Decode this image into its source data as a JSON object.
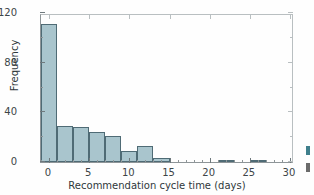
{
  "chart_data": {
    "type": "bar",
    "title": "",
    "xlabel": "Recommendation cycle time (days)",
    "ylabel": "Frequency",
    "xlim": [
      -1,
      30.5
    ],
    "ylim": [
      0,
      120
    ],
    "grid": false,
    "legend": null,
    "bin_width": 2,
    "bar_color": "#a9c5cd",
    "bar_edge_color": "#4f6b75",
    "x_ticks": [
      0,
      5,
      10,
      15,
      20,
      25,
      30
    ],
    "x_tick_labels": [
      "0",
      "5",
      "10",
      "15",
      "20",
      "25",
      "30"
    ],
    "x_minor_step": 1,
    "y_ticks": [
      0,
      40,
      80,
      120
    ],
    "y_tick_labels": [
      "0",
      "40",
      "80",
      "120"
    ],
    "y_minor_ticks": [
      20,
      60,
      100
    ],
    "bins": [
      {
        "x0": -1,
        "x1": 1,
        "value": 111
      },
      {
        "x0": 1,
        "x1": 3,
        "value": 29
      },
      {
        "x0": 3,
        "x1": 5,
        "value": 28
      },
      {
        "x0": 5,
        "x1": 7,
        "value": 24
      },
      {
        "x0": 7,
        "x1": 9,
        "value": 21
      },
      {
        "x0": 9,
        "x1": 11,
        "value": 9
      },
      {
        "x0": 11,
        "x1": 13,
        "value": 13
      },
      {
        "x0": 13,
        "x1": 15,
        "value": 3
      },
      {
        "x0": 15,
        "x1": 17,
        "value": 0
      },
      {
        "x0": 17,
        "x1": 19,
        "value": 0
      },
      {
        "x0": 19,
        "x1": 21,
        "value": 0
      },
      {
        "x0": 21,
        "x1": 23,
        "value": 2
      },
      {
        "x0": 23,
        "x1": 25,
        "value": 0
      },
      {
        "x0": 25,
        "x1": 27,
        "value": 2
      },
      {
        "x0": 27,
        "x1": 29,
        "value": 0
      }
    ]
  },
  "edge_fragments": [
    {
      "color": "#3f7f8c"
    },
    {
      "color": "#6b6b6b"
    }
  ]
}
